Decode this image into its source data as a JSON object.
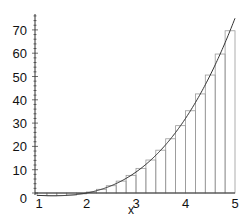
{
  "chart_data": {
    "type": "bar",
    "subtype": "midpoint-riemann-sum-with-curve",
    "title": "",
    "xlabel": "x",
    "ylabel": "",
    "function": "x^3 - 2x^2",
    "xlim": [
      1,
      5
    ],
    "ylim": [
      -3,
      78
    ],
    "grid": false,
    "legend": null,
    "x_ticks": [
      1,
      2,
      3,
      4,
      5
    ],
    "y_ticks": [
      0,
      10,
      20,
      30,
      40,
      50,
      60,
      70
    ],
    "y_minor_tick_step": 2,
    "bar_width": 0.2,
    "bar_left_edges": [
      1.0,
      1.2,
      1.4,
      1.6,
      1.8,
      2.0,
      2.2,
      2.4,
      2.6,
      2.8,
      3.0,
      3.2,
      3.4,
      3.6,
      3.8,
      4.0,
      4.2,
      4.4,
      4.6,
      4.8
    ],
    "midpoints": [
      1.1,
      1.3,
      1.5,
      1.7,
      1.9,
      2.1,
      2.3,
      2.5,
      2.7,
      2.9,
      3.1,
      3.3,
      3.5,
      3.7,
      3.9,
      4.1,
      4.3,
      4.5,
      4.7,
      4.9
    ],
    "values": [
      -1.089,
      -1.183,
      -1.125,
      -0.867,
      -0.361,
      0.441,
      1.587,
      3.125,
      5.103,
      7.569,
      10.571,
      14.157,
      18.375,
      23.273,
      28.899,
      35.301,
      42.527,
      50.625,
      59.643,
      69.629
    ],
    "colors": {
      "bars": "#9a9a9a",
      "curve": "#333333",
      "axes": "#333333",
      "text": "#111111"
    }
  }
}
